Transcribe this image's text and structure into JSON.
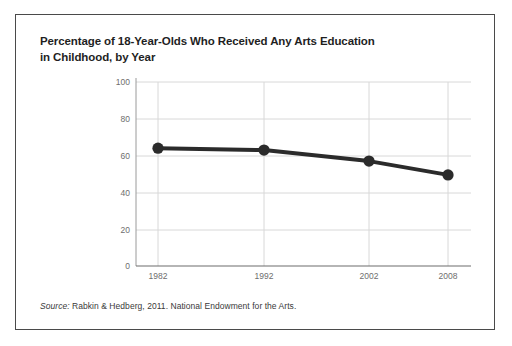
{
  "figure": {
    "title_line1": "Percentage of 18-Year-Olds Who Received Any Arts Education",
    "title_line2": "in Childhood, by Year",
    "source_label": "Source:",
    "source_text": " Rabkin & Hedberg, 2011. National Endowment for the Arts.",
    "border_color": "#4a4a4a",
    "background_color": "#ffffff"
  },
  "chart_data": {
    "type": "line",
    "title": "Percentage of 18-Year-Olds Who Received Any Arts Education in Childhood, by Year",
    "xlabel": "",
    "ylabel": "",
    "categories": [
      "1982",
      "1992",
      "2002",
      "2008"
    ],
    "x": [
      1982,
      1992,
      2002,
      2008
    ],
    "values": [
      64,
      63,
      57,
      49.5
    ],
    "series": [
      {
        "name": "Percentage receiving any arts education",
        "values": [
          64,
          63,
          57,
          49.5
        ]
      }
    ],
    "ylim": [
      0,
      100
    ],
    "yticks": [
      0,
      20,
      40,
      60,
      80,
      100
    ],
    "ytick_labels": [
      "0",
      "20",
      "40",
      "60",
      "80",
      "100"
    ],
    "xtick_labels": [
      "1982",
      "1992",
      "2002",
      "2008"
    ],
    "grid": true,
    "grid_color": "#d8d8d8",
    "legend": "none",
    "line_color": "#2b2b2b",
    "marker_color": "#2b2b2b",
    "marker": "circle",
    "line_width": 4,
    "marker_size": 9
  }
}
